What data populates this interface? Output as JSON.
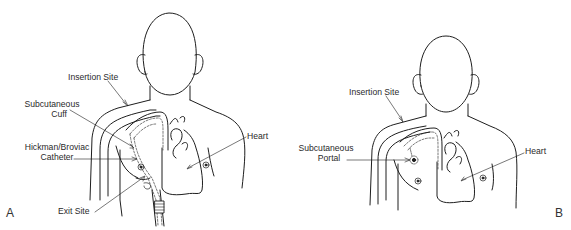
{
  "figure": {
    "panels": [
      {
        "id": "A",
        "letter": "A",
        "labels": {
          "insertion_site": "Insertion Site",
          "subcutaneous_cuff_line1": "Subcutaneous",
          "subcutaneous_cuff_line2": "Cuff",
          "catheter_line1": "Hickman/Broviac",
          "catheter_line2": "Catheter",
          "exit_site": "Exit Site",
          "heart": "Heart"
        }
      },
      {
        "id": "B",
        "letter": "B",
        "labels": {
          "insertion_site": "Insertion Site",
          "portal_line1": "Subcutaneous",
          "portal_line2": "Portal",
          "heart": "Heart"
        }
      }
    ],
    "colors": {
      "line": "#1e1e1e",
      "text": "#2a2a2a",
      "background": "#ffffff"
    }
  }
}
